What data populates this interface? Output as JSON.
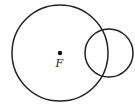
{
  "diagram": {
    "point_label": "F",
    "large_circle": {
      "cx": 60,
      "cy": 53,
      "r": 48
    },
    "small_circle": {
      "cx": 109,
      "cy": 53,
      "r": 24
    },
    "stroke_color": "#222222"
  }
}
